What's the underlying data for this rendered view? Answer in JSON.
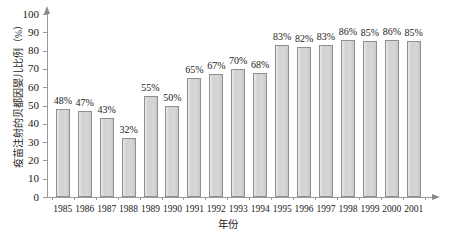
{
  "chart_data": {
    "type": "bar",
    "title": "",
    "xlabel": "年份",
    "ylabel": "疫苗注射的贝都因婴儿比例（%）",
    "categories": [
      "1985",
      "1986",
      "1987",
      "1988",
      "1989",
      "1990",
      "1991",
      "1992",
      "1993",
      "1994",
      "1995",
      "1996",
      "1997",
      "1998",
      "1999",
      "2000",
      "2001"
    ],
    "values": [
      48,
      47,
      43,
      32,
      55,
      50,
      65,
      67,
      70,
      68,
      83,
      82,
      83,
      86,
      85,
      86,
      85
    ],
    "data_labels": [
      "48%",
      "47%",
      "43%",
      "32%",
      "55%",
      "50%",
      "65%",
      "67%",
      "70%",
      "68%",
      "83%",
      "82%",
      "83%",
      "86%",
      "85%",
      "86%",
      "85%"
    ],
    "ylim": [
      0,
      100
    ],
    "ytick_labels": [
      "0",
      "10",
      "20",
      "30",
      "40",
      "50",
      "60",
      "70",
      "80",
      "90",
      "100"
    ],
    "ytick_values": [
      0,
      10,
      20,
      30,
      40,
      50,
      60,
      70,
      80,
      90,
      100
    ],
    "grid": false,
    "legend": false,
    "series": [
      {
        "name": "疫苗注射的贝都因婴儿比例",
        "values": [
          48,
          47,
          43,
          32,
          55,
          50,
          65,
          67,
          70,
          68,
          83,
          82,
          83,
          86,
          85,
          86,
          85
        ]
      }
    ]
  },
  "colors": {
    "bar_fill": "#d6d6d6",
    "bar_border": "#8f8f8f",
    "axis": "#9a9a9a",
    "text": "#1a1a1a",
    "background": "#ffffff"
  }
}
